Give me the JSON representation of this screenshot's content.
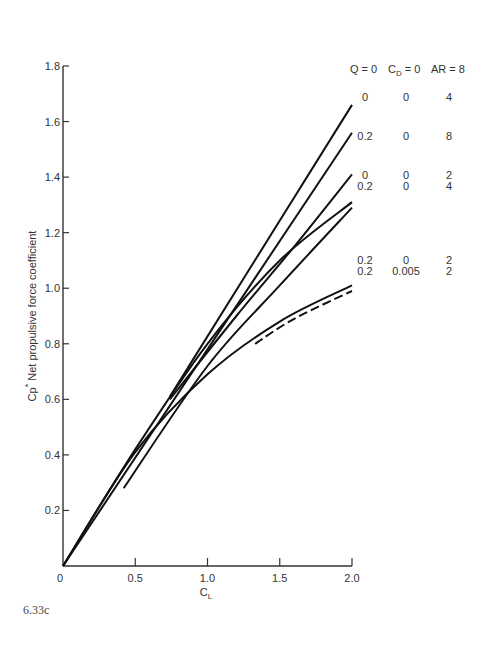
{
  "figure": {
    "caption": "6.33c"
  },
  "chart_data": {
    "type": "line",
    "title": "",
    "xlabel": "C_L",
    "ylabel": "Cp* Net propulsive force coefficient",
    "xlim": [
      0,
      2.0
    ],
    "ylim": [
      0,
      1.8
    ],
    "xticks": [
      0,
      0.5,
      1.0,
      1.5,
      2.0
    ],
    "xtick_labels": [
      "0",
      "0.5",
      "1.0",
      "1.5",
      "2.0"
    ],
    "yticks": [
      0.2,
      0.4,
      0.6,
      0.8,
      1.0,
      1.2,
      1.4,
      1.6,
      1.8
    ],
    "ytick_labels": [
      "0.2",
      "0.4",
      "0.6",
      "0.8",
      "1.0",
      "1.2",
      "1.4",
      "1.6",
      "1.8"
    ],
    "grid": false,
    "legend_position": "right, inline labels at curve ends",
    "legend_header": [
      "Q = 0",
      "C_D = 0",
      "AR = 8"
    ],
    "series": [
      {
        "name": "Q=0, CD=0, AR=8",
        "Q": "0",
        "CD": "0",
        "AR": "8",
        "style": "solid",
        "x": [
          0.74,
          2.0
        ],
        "y": [
          0.61,
          1.66
        ]
      },
      {
        "name": "Q=0, CD=0, AR=4",
        "Q": "0",
        "CD": "0",
        "AR": "4",
        "style": "solid",
        "x": [
          0.0,
          2.0
        ],
        "y": [
          0.0,
          1.56
        ]
      },
      {
        "name": "Q=0.2, CD=0, AR=8",
        "Q": "0.2",
        "CD": "0",
        "AR": "8",
        "style": "solid",
        "x": [
          0.74,
          1.2,
          1.6,
          2.0
        ],
        "y": [
          0.6,
          0.9,
          1.15,
          1.41
        ]
      },
      {
        "name": "Q=0, CD=0, AR=2",
        "Q": "0",
        "CD": "0",
        "AR": "2",
        "style": "solid",
        "x": [
          0.0,
          0.5,
          1.0,
          1.5,
          2.0
        ],
        "y": [
          0.0,
          0.42,
          0.8,
          1.1,
          1.31
        ]
      },
      {
        "name": "Q=0.2, CD=0, AR=4",
        "Q": "0.2",
        "CD": "0",
        "AR": "4",
        "style": "solid",
        "x": [
          0.42,
          1.0,
          1.5,
          2.0
        ],
        "y": [
          0.28,
          0.72,
          1.01,
          1.29
        ]
      },
      {
        "name": "Q=0.2, CD=0, AR=2",
        "Q": "0.2",
        "CD": "0",
        "AR": "2",
        "style": "solid",
        "x": [
          0.0,
          0.5,
          1.0,
          1.5,
          2.0
        ],
        "y": [
          0.0,
          0.41,
          0.69,
          0.88,
          1.01
        ]
      },
      {
        "name": "Q=0.2, CD=0.005, AR=2",
        "Q": "0.2",
        "CD": "0.005",
        "AR": "2",
        "style": "dashed",
        "x": [
          1.33,
          1.6,
          2.0
        ],
        "y": [
          0.8,
          0.89,
          0.99
        ]
      }
    ],
    "legend_rows": [
      {
        "Q": "Q = 0",
        "CD": "C_D = 0",
        "AR": "AR = 8"
      },
      {
        "Q": "0",
        "CD": "0",
        "AR": "4"
      },
      {
        "Q": "0.2",
        "CD": "0",
        "AR": "8"
      },
      {
        "Q": "0",
        "CD": "0",
        "AR": "2"
      },
      {
        "Q": "0.2",
        "CD": "0",
        "AR": "4"
      },
      {
        "Q": "0.2",
        "CD": "0",
        "AR": "2"
      },
      {
        "Q": "0.2",
        "CD": "0.005",
        "AR": "2"
      }
    ]
  },
  "labels": {
    "x_axis_main": "C",
    "x_axis_sub": "L",
    "y_axis_main": "Cp",
    "y_axis_sup": "*",
    "y_axis_rest": " Net propulsive force coefficient",
    "legend": {
      "header": {
        "q": "Q = 0",
        "cd_main": "C",
        "cd_sub": "D",
        "cd_rest": " = 0",
        "ar": "AR = 8"
      },
      "rows": [
        {
          "q": "0",
          "cd": "0",
          "ar": "4"
        },
        {
          "q": "0.2",
          "cd": "0",
          "ar": "8"
        },
        {
          "q": "0",
          "cd": "0",
          "ar": "2"
        },
        {
          "q": "0.2",
          "cd": "0",
          "ar": "4"
        },
        {
          "q": "0.2",
          "cd": "0",
          "ar": "2"
        },
        {
          "q": "0.2",
          "cd": "0.005",
          "ar": "2"
        }
      ]
    }
  }
}
